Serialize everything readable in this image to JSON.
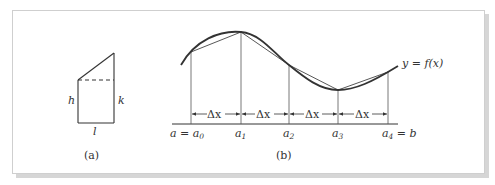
{
  "figure_a": {
    "caption": "(a)",
    "labels": {
      "left_side": "h",
      "right_side": "k",
      "base": "l"
    }
  },
  "figure_b": {
    "caption": "(b)",
    "curve_label": "y = f(x)",
    "interval_label": "Δx",
    "points": [
      {
        "name": "a0",
        "label": "a = a",
        "sub": "0"
      },
      {
        "name": "a1",
        "label": "a",
        "sub": "1"
      },
      {
        "name": "a2",
        "label": "a",
        "sub": "2"
      },
      {
        "name": "a3",
        "label": "a",
        "sub": "3"
      },
      {
        "name": "a4",
        "label": "a",
        "sub": "4",
        "suffix": " = b"
      }
    ]
  }
}
